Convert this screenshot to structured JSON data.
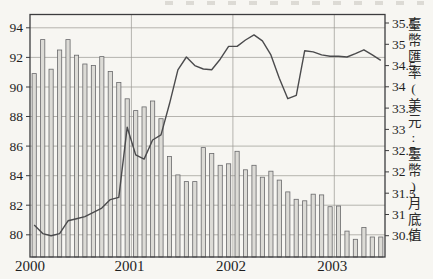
{
  "figure": {
    "kind": "scanned statistics figure, combo bar+line chart",
    "background_hex": "#f7f6f2",
    "frame_hex": "#3c3c3e",
    "grid_hex": "#9a9892",
    "bar_fill_hex": "#dcdbd6",
    "bar_stroke_hex": "#69696b",
    "line_hex": "#4b4b4d",
    "text_hex": "#1f1f1f"
  },
  "chart_data": {
    "type": "bar",
    "title": "",
    "xlabel": "",
    "ylabel_left": "",
    "ylabel_right": "臺幣匯率(美元:臺幣)月底值",
    "categories": [
      "2000-01",
      "2000-02",
      "2000-03",
      "2000-04",
      "2000-05",
      "2000-06",
      "2000-07",
      "2000-08",
      "2000-09",
      "2000-10",
      "2000-11",
      "2000-12",
      "2001-01",
      "2001-02",
      "2001-03",
      "2001-04",
      "2001-05",
      "2001-06",
      "2001-07",
      "2001-08",
      "2001-09",
      "2001-10",
      "2001-11",
      "2001-12",
      "2002-01",
      "2002-02",
      "2002-03",
      "2002-04",
      "2002-05",
      "2002-06",
      "2002-07",
      "2002-08",
      "2002-09",
      "2002-10",
      "2002-11",
      "2002-12",
      "2003-01",
      "2003-02",
      "2003-03",
      "2003-04",
      "2003-05",
      "2003-06"
    ],
    "series": [
      {
        "name": "monthly-index-bars",
        "type": "bar",
        "axis": "left",
        "values": [
          90.9,
          93.2,
          91.2,
          92.5,
          93.2,
          92.15,
          91.55,
          91.45,
          92.05,
          91.05,
          90.3,
          89.2,
          88.4,
          88.65,
          89.05,
          87.85,
          85.3,
          84.05,
          83.6,
          83.6,
          85.9,
          85.5,
          84.7,
          84.8,
          85.65,
          84.4,
          84.7,
          83.9,
          84.3,
          83.7,
          82.9,
          82.4,
          82.3,
          82.75,
          82.7,
          81.9,
          81.95,
          80.25,
          79.7,
          80.5,
          79.85,
          79.85
        ]
      },
      {
        "name": "twd-usd-month-end-rate-line",
        "type": "line",
        "axis": "right",
        "values": [
          30.75,
          30.55,
          30.5,
          30.55,
          30.85,
          30.9,
          30.95,
          31.05,
          31.15,
          31.35,
          31.4,
          33.05,
          32.4,
          32.3,
          32.75,
          32.87,
          33.6,
          34.4,
          34.7,
          34.5,
          34.42,
          34.4,
          34.65,
          34.95,
          34.95,
          35.1,
          35.22,
          35.08,
          34.75,
          34.2,
          33.72,
          33.8,
          34.85,
          34.82,
          34.75,
          34.72,
          34.72,
          34.7,
          34.78,
          34.87,
          34.75,
          34.62
        ]
      }
    ],
    "left_axis": {
      "ticks": [
        94,
        92,
        90,
        88,
        86,
        84,
        82,
        80
      ],
      "range": [
        78.5,
        94.9
      ]
    },
    "right_axis": {
      "ticks": [
        35.5,
        35,
        34.5,
        34,
        33.5,
        33,
        32.5,
        32,
        31.5,
        31,
        30.5
      ],
      "range": [
        30.0,
        35.7
      ],
      "title": "臺幣匯率(美元:臺幣)月底值"
    },
    "x_ticks": {
      "labels": [
        "2000",
        "2001",
        "2002",
        "2003"
      ],
      "month_boundaries": [
        0,
        12,
        24,
        36
      ]
    },
    "grid": {
      "horizontal": "left-axis-ticks",
      "vertical": "year-boundaries",
      "legend": "none"
    }
  }
}
